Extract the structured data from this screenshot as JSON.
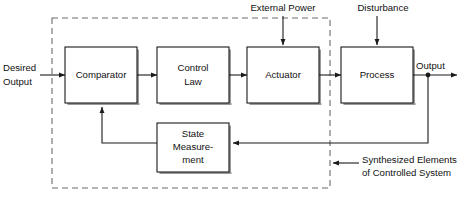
{
  "diagram": {
    "blocks": [
      {
        "id": "comparator",
        "label": "Comparator",
        "lines": [
          "Comparator"
        ]
      },
      {
        "id": "control-law",
        "label": "Control Law",
        "lines": [
          "Control",
          "Law"
        ]
      },
      {
        "id": "actuator",
        "label": "Actuator",
        "lines": [
          "Actuator"
        ]
      },
      {
        "id": "process",
        "label": "Process",
        "lines": [
          "Process"
        ]
      },
      {
        "id": "state-measurement",
        "label": "State Measurement",
        "lines": [
          "State",
          "Measure-",
          "ment"
        ]
      }
    ],
    "labels": {
      "desired_output_line1": "Desired",
      "desired_output_line2": "Output",
      "external_power": "External Power",
      "disturbance": "Disturbance",
      "output": "Output",
      "annotation_line1": "Synthesized Elements",
      "annotation_line2": "of Controlled System"
    },
    "colors": {
      "line": "#1a1a1a",
      "dashed_boundary": "#6b6b6b",
      "block_fill": "#ffffff",
      "block_shadow": "#9a9a9a",
      "text": "#111111",
      "background": "#ffffff"
    }
  }
}
